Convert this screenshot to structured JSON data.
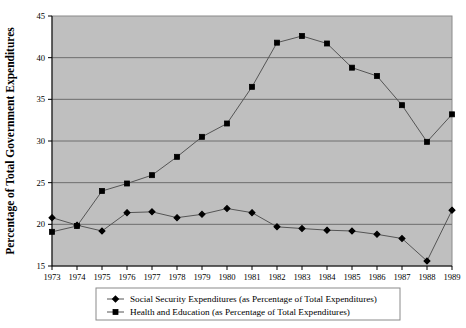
{
  "chart_data": {
    "type": "line",
    "title": "",
    "xlabel": "",
    "ylabel": "Percentage of Total Government Expenditures",
    "x": [
      1973,
      1974,
      1975,
      1976,
      1977,
      1978,
      1979,
      1980,
      1981,
      1982,
      1983,
      1984,
      1985,
      1986,
      1987,
      1988,
      1989
    ],
    "xtick_labels": [
      "1973",
      "1974",
      "1975",
      "1976",
      "1977",
      "1978",
      "1979",
      "1980",
      "1981",
      "1982",
      "1983",
      "1984",
      "1985",
      "1986",
      "1987",
      "1988",
      "1989"
    ],
    "xlim": [
      1973,
      1989
    ],
    "ylim": [
      15,
      45
    ],
    "ytick_labels": [
      "15",
      "20",
      "25",
      "30",
      "35",
      "40",
      "45"
    ],
    "yticks": [
      15,
      20,
      25,
      30,
      35,
      40,
      45
    ],
    "grid": "horizontal",
    "legend_position": "bottom",
    "plot_background": "#bfbfbf",
    "line_color": "#555555",
    "marker_color": "#000000",
    "series": [
      {
        "name": "Social Security Expenditures (as Percentage of Total Expenditures)",
        "marker": "diamond",
        "values": [
          20.8,
          19.9,
          19.2,
          21.4,
          21.5,
          20.8,
          21.2,
          21.9,
          21.4,
          19.7,
          19.5,
          19.3,
          19.2,
          18.8,
          18.3,
          15.6,
          21.7
        ]
      },
      {
        "name": "Health and Education (as Percentage of Total Expenditures)",
        "marker": "square",
        "values": [
          19.1,
          19.8,
          24.0,
          24.9,
          25.9,
          28.1,
          30.5,
          32.1,
          36.5,
          41.8,
          42.6,
          41.7,
          38.8,
          37.8,
          34.3,
          29.9,
          33.2
        ]
      }
    ]
  },
  "legend": {
    "entries": [
      {
        "label": "Social Security Expenditures (as Percentage of Total Expenditures)",
        "marker": "diamond"
      },
      {
        "label": "Health and Education (as Percentage of Total Expenditures)",
        "marker": "square"
      }
    ]
  }
}
